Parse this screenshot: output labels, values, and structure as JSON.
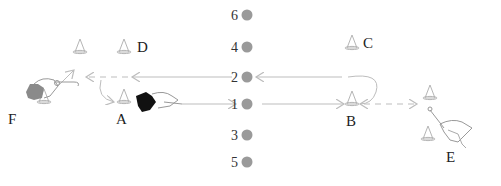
{
  "diagram": {
    "type": "drill-diagram",
    "markers": [
      {
        "label": "6",
        "order": 6
      },
      {
        "label": "4",
        "order": 4
      },
      {
        "label": "2",
        "order": 2
      },
      {
        "label": "1",
        "order": 1
      },
      {
        "label": "3",
        "order": 3
      },
      {
        "label": "5",
        "order": 5
      }
    ],
    "stations": [
      {
        "label": "A"
      },
      {
        "label": "B"
      },
      {
        "label": "C"
      },
      {
        "label": "D"
      },
      {
        "label": "E"
      },
      {
        "label": "F"
      }
    ],
    "colors": {
      "marker": "#9a9a9a",
      "cone": "#b5b5b5",
      "arrow": "#bdbdbd",
      "player_dark": "#111111",
      "player_gray": "#8a8a8a",
      "text": "#222222"
    }
  }
}
